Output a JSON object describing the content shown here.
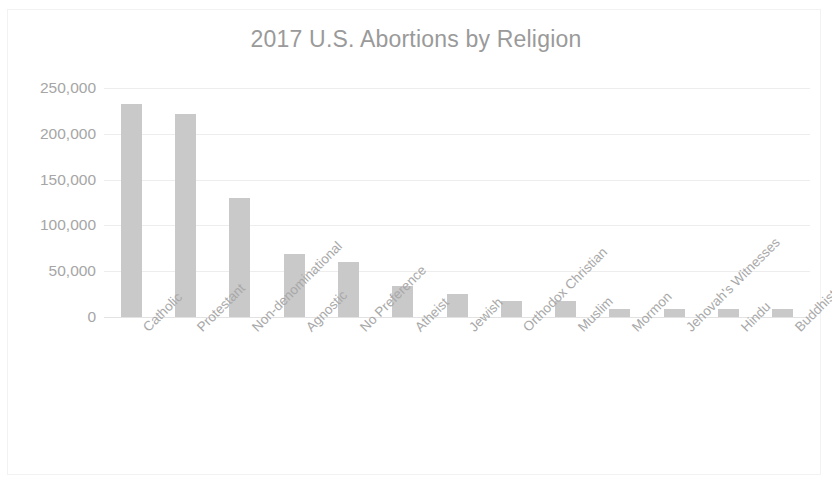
{
  "chart_data": {
    "type": "bar",
    "title": "2017 U.S. Abortions by Religion",
    "xlabel": "",
    "ylabel": "",
    "ylim": [
      0,
      250000
    ],
    "grid": true,
    "legend": "none",
    "y_ticks": [
      "0",
      "50,000",
      "100,000",
      "150,000",
      "200,000",
      "250,000"
    ],
    "y_tick_values": [
      0,
      50000,
      100000,
      150000,
      200000,
      250000
    ],
    "categories": [
      "Catholic",
      "Protestant",
      "Non-denominational",
      "Agnostic",
      "No Preference",
      "Atheist",
      "Jewish",
      "Orthodox Christian",
      "Muslim",
      "Mormon",
      "Jehovah's Witnesses",
      "Hindu",
      "Buddhist"
    ],
    "values": [
      232000,
      222000,
      130000,
      69000,
      60000,
      34000,
      25000,
      18000,
      17500,
      9000,
      9000,
      9000,
      8500
    ],
    "bar_color": "#c9c9c9",
    "gridline_color": "#ededed",
    "text_color": "#a6a6a6",
    "title_color": "#9a9a9a"
  }
}
